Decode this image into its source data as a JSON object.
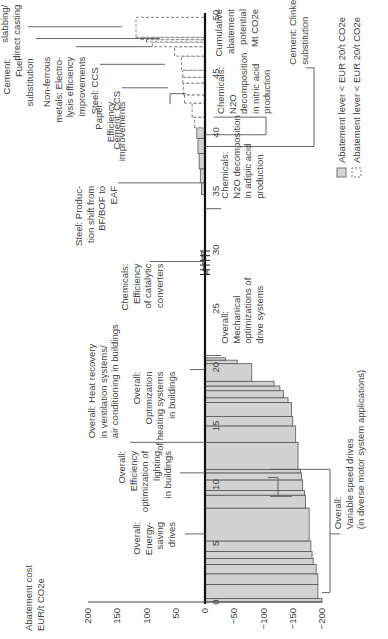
{
  "chart_data": {
    "type": "bar",
    "subtype": "marginal abatement cost curve (variable-width bars, rotated 90 degrees)",
    "title": "",
    "ylabel": "Abatement cost EUR/t CO2e",
    "xlabel": "Cumulative abatement potential Mt CO2e",
    "ylim": [
      -200,
      200
    ],
    "xlim": [
      0,
      50
    ],
    "y_ticks": [
      200,
      150,
      100,
      50,
      0,
      -50,
      -100,
      -150,
      -200
    ],
    "x_ticks": [
      0,
      5,
      10,
      15,
      20,
      25,
      30,
      35,
      40,
      45,
      50
    ],
    "legend": [
      {
        "label": "Abatement lever < EUR 20/t CO2e",
        "style": "solid-grey"
      },
      {
        "label": "Abatement lever < EUR 20/t CO2e",
        "style": "dashed-white"
      }
    ],
    "bars": [
      {
        "start": 0.0,
        "end": 0.3,
        "cost": -200,
        "style": "solid"
      },
      {
        "start": 0.3,
        "end": 1.5,
        "cost": -193,
        "style": "solid"
      },
      {
        "start": 1.5,
        "end": 2.4,
        "cost": -193,
        "style": "solid"
      },
      {
        "start": 2.4,
        "end": 3.2,
        "cost": -190,
        "style": "solid"
      },
      {
        "start": 3.2,
        "end": 3.7,
        "cost": -185,
        "style": "solid"
      },
      {
        "start": 3.7,
        "end": 4.3,
        "cost": -183,
        "style": "solid"
      },
      {
        "start": 4.3,
        "end": 5.2,
        "cost": -181,
        "style": "solid"
      },
      {
        "start": 5.2,
        "end": 8.0,
        "cost": -178,
        "style": "solid"
      },
      {
        "start": 8.0,
        "end": 9.1,
        "cost": -172,
        "style": "solid"
      },
      {
        "start": 9.1,
        "end": 9.5,
        "cost": -170,
        "style": "solid"
      },
      {
        "start": 9.5,
        "end": 10.4,
        "cost": -167,
        "style": "solid"
      },
      {
        "start": 10.4,
        "end": 11.0,
        "cost": -165,
        "style": "solid"
      },
      {
        "start": 11.0,
        "end": 11.3,
        "cost": -163,
        "style": "solid"
      },
      {
        "start": 11.3,
        "end": 13.6,
        "cost": -159,
        "style": "solid"
      },
      {
        "start": 13.6,
        "end": 15.0,
        "cost": -155,
        "style": "solid"
      },
      {
        "start": 15.0,
        "end": 15.8,
        "cost": -150,
        "style": "solid"
      },
      {
        "start": 15.8,
        "end": 17.0,
        "cost": -148,
        "style": "solid"
      },
      {
        "start": 17.0,
        "end": 17.4,
        "cost": -142,
        "style": "solid"
      },
      {
        "start": 17.4,
        "end": 18.0,
        "cost": -134,
        "style": "solid"
      },
      {
        "start": 18.0,
        "end": 18.4,
        "cost": -128,
        "style": "solid"
      },
      {
        "start": 18.4,
        "end": 18.8,
        "cost": -118,
        "style": "solid"
      },
      {
        "start": 18.8,
        "end": 20.3,
        "cost": -80,
        "style": "solid"
      },
      {
        "start": 20.3,
        "end": 20.6,
        "cost": -55,
        "style": "solid"
      },
      {
        "start": 20.6,
        "end": 20.8,
        "cost": -35,
        "style": "solid"
      },
      {
        "start": 28.0,
        "end": 28.2,
        "cost": -5,
        "style": "solid"
      },
      {
        "start": 28.2,
        "end": 28.5,
        "cost": 3,
        "style": "solid"
      },
      {
        "start": 28.5,
        "end": 28.8,
        "cost": 3,
        "style": "solid"
      },
      {
        "start": 28.8,
        "end": 29.0,
        "cost": 4,
        "style": "solid"
      },
      {
        "start": 29.0,
        "end": 29.2,
        "cost": 4,
        "style": "solid"
      },
      {
        "start": 29.2,
        "end": 29.4,
        "cost": 5,
        "style": "solid"
      },
      {
        "start": 29.4,
        "end": 29.6,
        "cost": 5,
        "style": "solid"
      },
      {
        "start": 29.6,
        "end": 29.8,
        "cost": 6,
        "style": "solid"
      },
      {
        "start": 34.7,
        "end": 35.7,
        "cost": 6,
        "style": "solid"
      },
      {
        "start": 35.7,
        "end": 36.9,
        "cost": 8,
        "style": "solid"
      },
      {
        "start": 36.9,
        "end": 38.2,
        "cost": 10,
        "style": "solid"
      },
      {
        "start": 38.2,
        "end": 39.5,
        "cost": 12,
        "style": "solid"
      },
      {
        "start": 39.5,
        "end": 40.4,
        "cost": 14,
        "style": "solid"
      },
      {
        "start": 40.4,
        "end": 41.3,
        "cost": 18,
        "style": "dashed"
      },
      {
        "start": 41.3,
        "end": 42.5,
        "cost": 22,
        "style": "dashed"
      },
      {
        "start": 42.5,
        "end": 43.2,
        "cost": 35,
        "style": "dashed"
      },
      {
        "start": 43.2,
        "end": 44.2,
        "cost": 37,
        "style": "dashed"
      },
      {
        "start": 44.2,
        "end": 44.7,
        "cost": 38,
        "style": "dashed"
      },
      {
        "start": 44.7,
        "end": 45.3,
        "cost": 38,
        "style": "dashed"
      },
      {
        "start": 45.3,
        "end": 46.5,
        "cost": 40,
        "style": "dashed"
      },
      {
        "start": 46.5,
        "end": 47.3,
        "cost": 52,
        "style": "dashed"
      },
      {
        "start": 47.3,
        "end": 47.7,
        "cost": 90,
        "style": "dashed"
      },
      {
        "start": 47.7,
        "end": 47.9,
        "cost": 100,
        "style": "dashed"
      },
      {
        "start": 47.9,
        "end": 48.1,
        "cost": 110,
        "style": "dashed"
      },
      {
        "start": 48.1,
        "end": 49.8,
        "cost": 118,
        "style": "dashed"
      }
    ],
    "annotations": [
      {
        "text": "Overall: Variable speed drives (in diverse motor system applications)",
        "range": [
          0,
          11.5
        ]
      },
      {
        "text": "Overall: Energy-saving drives",
        "at": 5.8
      },
      {
        "text": "Overall: Efficiency optimization of lighting in buildings",
        "at": 11.0
      },
      {
        "text": "Overall: Heat recovery in ventilation systems/ air conditioning in buildings",
        "at": 13.6
      },
      {
        "text": "Overall: Optimization of heating systems in buildings",
        "at": 19.8
      },
      {
        "text": "Overall: Mechanical optimizations of drive systems",
        "at": 21.0
      },
      {
        "text": "Chemicals: Efficiency of catalytic converters",
        "at": 29.0
      },
      {
        "text": "Chemicals: N2O decomposition in adipic acid production",
        "at": 33.5
      },
      {
        "text": "Steel: Production shift from BF/BOF to EAF",
        "at": 35.7
      },
      {
        "text": "Chemicals: N2O decomposition in nitric acid production",
        "at": 39.8
      },
      {
        "text": "Cement: Clinker substitution",
        "at": 38.8
      },
      {
        "text": "Paper: Efficiency improvements",
        "at": 43.3
      },
      {
        "text": "Cement: CCS",
        "at": 43.8
      },
      {
        "text": "Steel: CCS",
        "at": 45.8
      },
      {
        "text": "Non-ferrous metals: Electrolysis efficiency improvements",
        "at": 47.3
      },
      {
        "text": "Cement: Fuel substitution",
        "at": 48.0
      },
      {
        "text": "Steel: Thin slabbing/ direct casting",
        "at": 49.0
      }
    ]
  },
  "axis": {
    "y_title_line1": "Abatement cost",
    "y_title_line2": "EUR/t CO2e",
    "x_title_line1": "Cumulative",
    "x_title_line2": "abatement",
    "x_title_line3": "potential",
    "x_title_line4": "Mt CO2e"
  },
  "legend": {
    "solid_label": "Abatement lever < EUR 20/t CO2e",
    "dashed_label": "Abatement lever < EUR 20/t CO2e"
  }
}
